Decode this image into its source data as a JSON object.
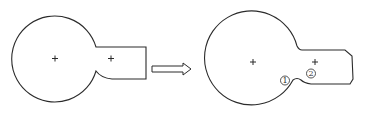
{
  "diagram": {
    "before_shape": {
      "name": "original-outline",
      "center_marks": [
        "+",
        "+"
      ]
    },
    "transform_arrow": {
      "direction": "right"
    },
    "after_shape": {
      "name": "modified-outline",
      "center_marks": [
        "+",
        "+"
      ],
      "labels": [
        {
          "id": "1",
          "text": "1"
        },
        {
          "id": "2",
          "text": "2"
        }
      ]
    },
    "colors": {
      "stroke": "#2b2b2b",
      "background": "#ffffff"
    }
  }
}
